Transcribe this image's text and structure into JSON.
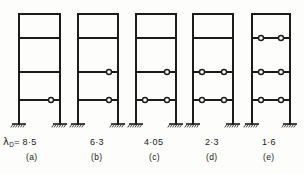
{
  "figure": {
    "background_color": "#fdfdfb",
    "line_color": "#1c1c1c",
    "lambda_symbol": "λ",
    "lambda_subscript": "D",
    "lambda_equals": " = ",
    "storeys": 4,
    "beam_levels_label": [
      "level-1",
      "level-2",
      "level-3",
      "level-4"
    ]
  },
  "chart_data": {
    "type": "diagram",
    "xlabel": "",
    "ylabel": "",
    "categories": [
      "(a)",
      "(b)",
      "(c)",
      "(d)",
      "(e)"
    ],
    "values": [
      8.5,
      6.3,
      4.05,
      2.3,
      1.6
    ],
    "series": [
      {
        "name": "lambda_D",
        "values": [
          8.5,
          6.3,
          4.05,
          2.3,
          1.6
        ]
      },
      {
        "name": "hinge_count",
        "values": [
          1,
          2,
          3,
          4,
          6
        ]
      }
    ],
    "annotations": [
      "λD = 8·5",
      "6·3",
      "4·05",
      "2·3",
      "1·6"
    ]
  },
  "frames": [
    {
      "id": "frame-a",
      "caption": "(a)",
      "lambda_prefix": "λ",
      "lambda_sub": "D",
      "lambda_text": "= 8·5",
      "value_text": "8·5",
      "value": 8.5,
      "x_left": 19,
      "x_right": 60,
      "hinges": [
        {
          "level": 1,
          "side": "right"
        }
      ]
    },
    {
      "id": "frame-b",
      "caption": "(b)",
      "lambda_text": "6·3",
      "value_text": "6·3",
      "value": 6.3,
      "x_left": 78,
      "x_right": 118,
      "hinges": [
        {
          "level": 1,
          "side": "right"
        },
        {
          "level": 2,
          "side": "right"
        }
      ]
    },
    {
      "id": "frame-c",
      "caption": "(c)",
      "lambda_text": "4·05",
      "value_text": "4·05",
      "value": 4.05,
      "x_left": 136,
      "x_right": 176,
      "hinges": [
        {
          "level": 1,
          "side": "left"
        },
        {
          "level": 1,
          "side": "right"
        },
        {
          "level": 2,
          "side": "right"
        }
      ]
    },
    {
      "id": "frame-d",
      "caption": "(d)",
      "lambda_text": "2·3",
      "value_text": "2·3",
      "value": 2.3,
      "x_left": 193,
      "x_right": 233,
      "hinges": [
        {
          "level": 1,
          "side": "left"
        },
        {
          "level": 1,
          "side": "right"
        },
        {
          "level": 2,
          "side": "left"
        },
        {
          "level": 2,
          "side": "right"
        }
      ]
    },
    {
      "id": "frame-e",
      "caption": "(e)",
      "lambda_text": "1·6",
      "value_text": "1·6",
      "value": 1.6,
      "x_left": 252,
      "x_right": 290,
      "hinges": [
        {
          "level": 1,
          "side": "left"
        },
        {
          "level": 1,
          "side": "right"
        },
        {
          "level": 2,
          "side": "left"
        },
        {
          "level": 2,
          "side": "right"
        },
        {
          "level": 3,
          "side": "left"
        },
        {
          "level": 3,
          "side": "right"
        }
      ]
    }
  ],
  "labels": {
    "a_value": "8·5",
    "b_value": "6·3",
    "c_value": "4·05",
    "d_value": "2·3",
    "e_value": "1·6",
    "a_caption": "(a)",
    "b_caption": "(b)",
    "c_caption": "(c)",
    "d_caption": "(d)",
    "e_caption": "(e)"
  }
}
